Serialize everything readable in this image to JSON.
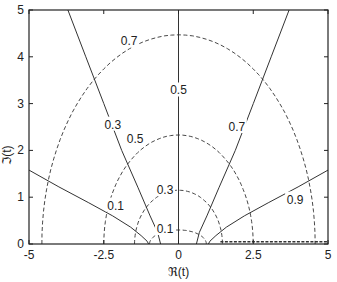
{
  "chart_data": {
    "type": "line",
    "title": "",
    "xlabel": "ℜ(t)",
    "ylabel": "ℑ(t)",
    "xlim": [
      -5,
      5
    ],
    "ylim": [
      0,
      5
    ],
    "grid": false,
    "legend": "none",
    "x_ticks": [
      -5,
      -2.5,
      0,
      2.5,
      5
    ],
    "x_tick_labels": [
      "-5",
      "-2.5",
      "0",
      "2.5",
      "5"
    ],
    "y_ticks": [
      0,
      1,
      2,
      3,
      4,
      5
    ],
    "y_tick_labels": [
      "0",
      "1",
      "2",
      "3",
      "4",
      "5"
    ],
    "series": [
      {
        "name": "0.1",
        "style": "solid",
        "points": [
          [
            -5,
            1.58
          ],
          [
            -4.0,
            1.22
          ],
          [
            -3.0,
            0.88
          ],
          [
            -2.2,
            0.6
          ],
          [
            -1.6,
            0.36
          ],
          [
            -1.25,
            0.18
          ],
          [
            -1.05,
            0.06
          ],
          [
            -1.0,
            0
          ]
        ],
        "label_at": [
          -2.1,
          0.82
        ]
      },
      {
        "name": "0.3",
        "style": "solid",
        "points": [
          [
            -3.7,
            5
          ],
          [
            -3.1,
            4.0
          ],
          [
            -2.5,
            3.0
          ],
          [
            -1.9,
            2.0
          ],
          [
            -1.35,
            1.2
          ],
          [
            -0.95,
            0.6
          ],
          [
            -0.7,
            0.25
          ],
          [
            -0.6,
            0
          ]
        ],
        "label_at": [
          -2.2,
          2.55
        ]
      },
      {
        "name": "0.5",
        "style": "solid",
        "points": [
          [
            0,
            5
          ],
          [
            0,
            0
          ]
        ],
        "label_at": [
          0,
          3.28
        ]
      },
      {
        "name": "0.7",
        "style": "solid",
        "points": [
          [
            3.7,
            5
          ],
          [
            3.1,
            4.0
          ],
          [
            2.5,
            3.0
          ],
          [
            1.9,
            2.0
          ],
          [
            1.35,
            1.2
          ],
          [
            0.95,
            0.6
          ],
          [
            0.7,
            0.25
          ],
          [
            0.6,
            0
          ]
        ],
        "label_at": [
          1.95,
          2.5
        ]
      },
      {
        "name": "0.9",
        "style": "solid",
        "points": [
          [
            5,
            1.58
          ],
          [
            4.0,
            1.22
          ],
          [
            3.0,
            0.88
          ],
          [
            2.2,
            0.6
          ],
          [
            1.6,
            0.36
          ],
          [
            1.25,
            0.18
          ],
          [
            1.05,
            0.06
          ],
          [
            1.0,
            0
          ]
        ],
        "label_at": [
          3.9,
          0.95
        ]
      },
      {
        "name": "0.1",
        "style": "dashed",
        "ellipse": {
          "cx": 0,
          "rx_left": 0.97,
          "rx_right": 0.93,
          "ry": 0.3
        },
        "tail": [
          [
            1.4,
            0.05
          ],
          [
            5,
            0.05
          ]
        ],
        "label_at": [
          -0.45,
          0.32
        ]
      },
      {
        "name": "0.3",
        "style": "dashed",
        "ellipse": {
          "cx": 0,
          "rx_left": 1.47,
          "rx_right": 1.47,
          "ry": 1.15
        },
        "label_at": [
          -0.45,
          1.15
        ]
      },
      {
        "name": "0.5",
        "style": "dashed",
        "ellipse": {
          "cx": 0,
          "rx_left": 2.5,
          "rx_right": 2.5,
          "ry": 2.33
        },
        "label_at": [
          -1.45,
          2.25
        ]
      },
      {
        "name": "0.7",
        "style": "dashed",
        "ellipse": {
          "cx": 0,
          "rx_left": 4.57,
          "rx_right": 4.57,
          "ry": 4.47
        },
        "label_at": [
          -1.65,
          4.33
        ]
      }
    ]
  },
  "axes": {
    "x_label": "ℜ(t)",
    "y_label": "ℑ(t)"
  },
  "colors": {
    "line": "#333333",
    "frame": "#222222",
    "background": "#ffffff"
  }
}
